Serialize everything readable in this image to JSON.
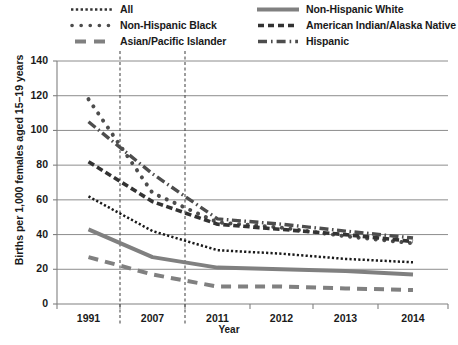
{
  "chart_data": {
    "type": "line",
    "title": "",
    "xlabel": "Year",
    "ylabel": "Births per 1,000 females aged 15–19 years",
    "x": [
      "1991",
      "2007",
      "2011",
      "2012",
      "2013",
      "2014"
    ],
    "xtick_labels": [
      "1991",
      "2007",
      "2011",
      "2012",
      "2013",
      "2014"
    ],
    "ytick_labels": [
      "0",
      "20",
      "40",
      "60",
      "80",
      "100",
      "120",
      "140"
    ],
    "ylim": [
      0,
      140
    ],
    "ytick_step": 20,
    "grid": "horizontal",
    "legend_position": "above-plot",
    "reference_lines": [
      "2007",
      "2011"
    ],
    "series": [
      {
        "name": "All",
        "style": "fine-dotted",
        "values": [
          62,
          42,
          31,
          29,
          26,
          24
        ]
      },
      {
        "name": "Non-Hispanic White",
        "style": "solid",
        "values": [
          43,
          27,
          21,
          20,
          19,
          17
        ]
      },
      {
        "name": "Non-Hispanic Black",
        "style": "round-dotted",
        "values": [
          118,
          64,
          47,
          44,
          39,
          35
        ]
      },
      {
        "name": "American Indian/Alaska Native",
        "style": "dashed",
        "values": [
          82,
          59,
          46,
          43,
          40,
          36
        ]
      },
      {
        "name": "Asian/Pacific Islander",
        "style": "long-dashed",
        "values": [
          27,
          17,
          10,
          10,
          9,
          8
        ]
      },
      {
        "name": "Hispanic",
        "style": "dash-dot",
        "values": [
          105,
          75,
          49,
          46,
          42,
          38
        ]
      }
    ]
  },
  "legend": {
    "columns": [
      {
        "entries": [
          {
            "label": "All",
            "style": "fine-dotted"
          },
          {
            "label": "Non-Hispanic Black",
            "style": "round-dotted"
          },
          {
            "label": "Asian/Pacific Islander",
            "style": "long-dashed"
          }
        ]
      },
      {
        "entries": [
          {
            "label": "Non-Hispanic White",
            "style": "solid"
          },
          {
            "label": "American Indian/Alaska Native",
            "style": "dashed"
          },
          {
            "label": "Hispanic",
            "style": "dash-dot"
          }
        ]
      }
    ]
  },
  "colors": {
    "line": "#4d4d4d",
    "line_dark": "#333333",
    "axis": "#808080",
    "grid": "#808080",
    "text": "#1a1a1a",
    "background": "#ffffff"
  }
}
